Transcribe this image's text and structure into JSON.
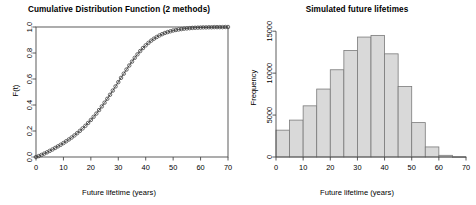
{
  "figure": {
    "background": "#ffffff",
    "width": 476,
    "height": 205
  },
  "chart_data": [
    {
      "id": "cdf",
      "type": "line",
      "title": "Cumulative Distribution Function (2 methods)",
      "xlabel": "Future lifetime (years)",
      "ylabel": "F(t)",
      "xlim": [
        0,
        70
      ],
      "ylim": [
        0.0,
        1.0
      ],
      "xticks": [
        0,
        10,
        20,
        30,
        40,
        50,
        60,
        70
      ],
      "xticklabels": [
        "0",
        "10",
        "20",
        "30",
        "40",
        "50",
        "60",
        "70"
      ],
      "yticks": [
        0.0,
        0.2,
        0.4,
        0.6,
        0.8,
        1.0
      ],
      "yticklabels": [
        "0.0",
        "0.2",
        "0.4",
        "0.6",
        "0.8",
        "1.0"
      ],
      "grid": false,
      "legend": null,
      "frame": "box",
      "line_color": "#3c3c3c",
      "marker_color": "#3c3c3c",
      "marker": "open-circle",
      "series": [
        {
          "name": "method-1-line",
          "style": "line",
          "x": [
            0,
            1,
            2,
            3,
            4,
            5,
            6,
            7,
            8,
            9,
            10,
            11,
            12,
            13,
            14,
            15,
            16,
            17,
            18,
            19,
            20,
            21,
            22,
            23,
            24,
            25,
            26,
            27,
            28,
            29,
            30,
            31,
            32,
            33,
            34,
            35,
            36,
            37,
            38,
            39,
            40,
            41,
            42,
            43,
            44,
            45,
            46,
            47,
            48,
            49,
            50,
            51,
            52,
            53,
            54,
            55,
            56,
            57,
            58,
            59,
            60,
            61,
            62,
            63,
            64,
            65,
            66,
            67,
            68,
            69,
            70
          ],
          "y": [
            0.0,
            0.007,
            0.016,
            0.026,
            0.036,
            0.047,
            0.058,
            0.07,
            0.082,
            0.094,
            0.107,
            0.121,
            0.135,
            0.15,
            0.166,
            0.183,
            0.201,
            0.22,
            0.24,
            0.262,
            0.285,
            0.309,
            0.334,
            0.361,
            0.389,
            0.418,
            0.448,
            0.479,
            0.511,
            0.543,
            0.576,
            0.609,
            0.641,
            0.673,
            0.704,
            0.734,
            0.763,
            0.79,
            0.815,
            0.838,
            0.859,
            0.878,
            0.895,
            0.91,
            0.923,
            0.935,
            0.945,
            0.954,
            0.961,
            0.967,
            0.973,
            0.977,
            0.981,
            0.984,
            0.987,
            0.989,
            0.991,
            0.993,
            0.994,
            0.995,
            0.996,
            0.997,
            0.997,
            0.998,
            0.998,
            0.999,
            0.999,
            0.999,
            0.999,
            1.0,
            1.0
          ]
        },
        {
          "name": "method-2-points",
          "style": "points",
          "x": [
            0,
            1,
            2,
            3,
            4,
            5,
            6,
            7,
            8,
            9,
            10,
            11,
            12,
            13,
            14,
            15,
            16,
            17,
            18,
            19,
            20,
            21,
            22,
            23,
            24,
            25,
            26,
            27,
            28,
            29,
            30,
            31,
            32,
            33,
            34,
            35,
            36,
            37,
            38,
            39,
            40,
            41,
            42,
            43,
            44,
            45,
            46,
            47,
            48,
            49,
            50,
            51,
            52,
            53,
            54,
            55,
            56,
            57,
            58,
            59,
            60,
            61,
            62,
            63,
            64,
            65,
            66,
            67,
            68,
            69,
            70
          ],
          "y": [
            0.0,
            0.007,
            0.016,
            0.026,
            0.036,
            0.047,
            0.058,
            0.07,
            0.082,
            0.094,
            0.107,
            0.121,
            0.135,
            0.15,
            0.166,
            0.183,
            0.201,
            0.22,
            0.24,
            0.262,
            0.285,
            0.309,
            0.334,
            0.361,
            0.389,
            0.418,
            0.448,
            0.479,
            0.511,
            0.543,
            0.576,
            0.609,
            0.641,
            0.673,
            0.704,
            0.734,
            0.763,
            0.79,
            0.815,
            0.838,
            0.859,
            0.878,
            0.895,
            0.91,
            0.923,
            0.935,
            0.945,
            0.954,
            0.961,
            0.967,
            0.973,
            0.977,
            0.981,
            0.984,
            0.987,
            0.989,
            0.991,
            0.993,
            0.994,
            0.995,
            0.996,
            0.997,
            0.997,
            0.998,
            0.998,
            0.999,
            0.999,
            0.999,
            0.999,
            1.0,
            1.0
          ]
        }
      ]
    },
    {
      "id": "histogram",
      "type": "bar",
      "title": "Simulated future lifetimes",
      "xlabel": "Future lifetime (years)",
      "ylabel": "Frequency",
      "xlim": [
        0,
        70
      ],
      "ylim": [
        0,
        15500
      ],
      "xticks": [
        0,
        10,
        20,
        30,
        40,
        50,
        60,
        70
      ],
      "xticklabels": [
        "0",
        "10",
        "20",
        "30",
        "40",
        "50",
        "60",
        "70"
      ],
      "yticks": [
        0,
        5000,
        10000,
        15000
      ],
      "yticklabels": [
        "0",
        "5000",
        "10000",
        "15000"
      ],
      "grid": false,
      "legend": null,
      "frame": "axes-only",
      "bar_fill": "#d9d9d9",
      "bar_border": "#7a7a7a",
      "bin_width": 5,
      "bin_edges": [
        0,
        5,
        10,
        15,
        20,
        25,
        30,
        35,
        40,
        45,
        50,
        55,
        60,
        65,
        70
      ],
      "categories": [
        "0-5",
        "5-10",
        "10-15",
        "15-20",
        "20-25",
        "25-30",
        "30-35",
        "35-40",
        "40-45",
        "45-50",
        "50-55",
        "55-60",
        "60-65",
        "65-70"
      ],
      "values": [
        3200,
        4400,
        6100,
        8100,
        10400,
        12700,
        14300,
        14500,
        12300,
        8400,
        4100,
        1200,
        200,
        30
      ]
    }
  ]
}
